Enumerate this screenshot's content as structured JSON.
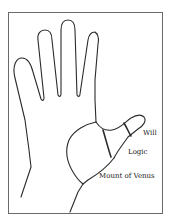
{
  "diagram": {
    "labels": {
      "will": "Will",
      "logic": "Logic",
      "mount_of_venus": "Mount of Venus"
    },
    "colors": {
      "line": "#2a2a2a",
      "frame": "#6a6a6a",
      "background": "#ffffff"
    }
  }
}
